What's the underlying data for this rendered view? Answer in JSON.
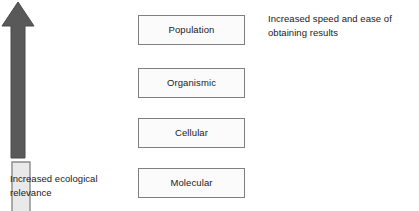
{
  "diagram": {
    "background_color": "#ffffff",
    "levels": [
      {
        "label": "Population",
        "fill": "#fbfbfb",
        "border": "#7f7f7f"
      },
      {
        "label": "Organismic",
        "fill": "#fbfbfb",
        "border": "#7f7f7f"
      },
      {
        "label": "Cellular",
        "fill": "#fbfbfb",
        "border": "#7f7f7f"
      },
      {
        "label": "Molecular",
        "fill": "#fbfbfb",
        "border": "#7f7f7f"
      }
    ],
    "left_arrow": {
      "name": "up-arrow",
      "direction": "up",
      "fill": "#595959",
      "stroke": "#4a4a4a"
    },
    "right_arrow": {
      "name": "down-arrow",
      "direction": "down",
      "fill": "#e9e9e9",
      "stroke": "#8a8a8a"
    },
    "captions": {
      "left": {
        "line1": "Increased ecological",
        "line2": "relevance"
      },
      "right": {
        "line1": "Increased speed and ease of",
        "line2": "obtaining results"
      }
    }
  }
}
